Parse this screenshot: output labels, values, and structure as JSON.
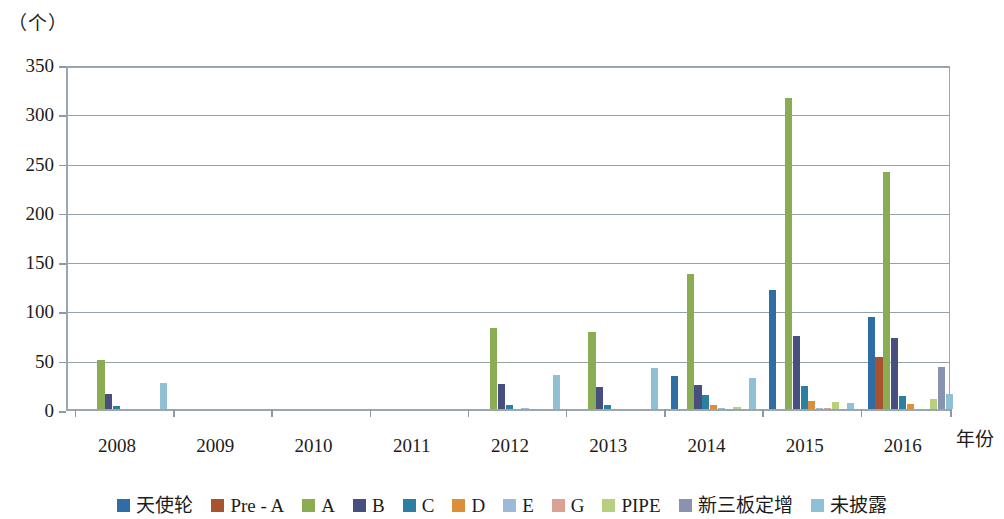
{
  "chart_data": {
    "type": "bar",
    "title": "",
    "subtitle": "",
    "xlabel": "年份",
    "ylabel": "（个）",
    "ylim": [
      0,
      350
    ],
    "ytick_step": 50,
    "yticks": [
      "0",
      "50",
      "100",
      "150",
      "200",
      "250",
      "300",
      "350"
    ],
    "grid": true,
    "legend_position": "bottom",
    "categories": [
      "2008",
      "2009",
      "2010",
      "2011",
      "2012",
      "2013",
      "2014",
      "2015",
      "2016"
    ],
    "series": [
      {
        "name": "天使轮",
        "color": "#2f6ea5",
        "values": [
          0,
          0,
          0,
          0,
          0,
          0,
          33,
          121,
          93
        ]
      },
      {
        "name": "Pre - A",
        "color": "#a9522f",
        "values": [
          0,
          0,
          0,
          0,
          0,
          0,
          0,
          0,
          53
        ]
      },
      {
        "name": "A",
        "color": "#8aac52",
        "values": [
          50,
          0,
          0,
          0,
          82,
          78,
          137,
          316,
          240
        ]
      },
      {
        "name": "B",
        "color": "#464f7e",
        "values": [
          15,
          0,
          0,
          0,
          25,
          22,
          24,
          74,
          72
        ]
      },
      {
        "name": "C",
        "color": "#2c7fa0",
        "values": [
          3,
          0,
          0,
          0,
          4,
          4,
          14,
          23,
          13
        ]
      },
      {
        "name": "D",
        "color": "#dc8e3a",
        "values": [
          0,
          0,
          0,
          0,
          0,
          0,
          4,
          8,
          5
        ]
      },
      {
        "name": "E",
        "color": "#9cb9d8",
        "values": [
          0,
          0,
          0,
          0,
          1,
          0,
          1,
          1,
          0
        ]
      },
      {
        "name": "G",
        "color": "#d9a294",
        "values": [
          0,
          0,
          0,
          0,
          0,
          0,
          0,
          1,
          0
        ]
      },
      {
        "name": "PIPE",
        "color": "#b8cf7e",
        "values": [
          0,
          0,
          0,
          0,
          0,
          0,
          2,
          7,
          10
        ]
      },
      {
        "name": "新三板定增",
        "color": "#8a93ae",
        "values": [
          0,
          0,
          0,
          0,
          0,
          0,
          0,
          0,
          43
        ]
      },
      {
        "name": "未披露",
        "color": "#8fc0d3",
        "values": [
          26,
          0,
          0,
          0,
          35,
          42,
          31,
          6,
          15
        ]
      }
    ]
  }
}
